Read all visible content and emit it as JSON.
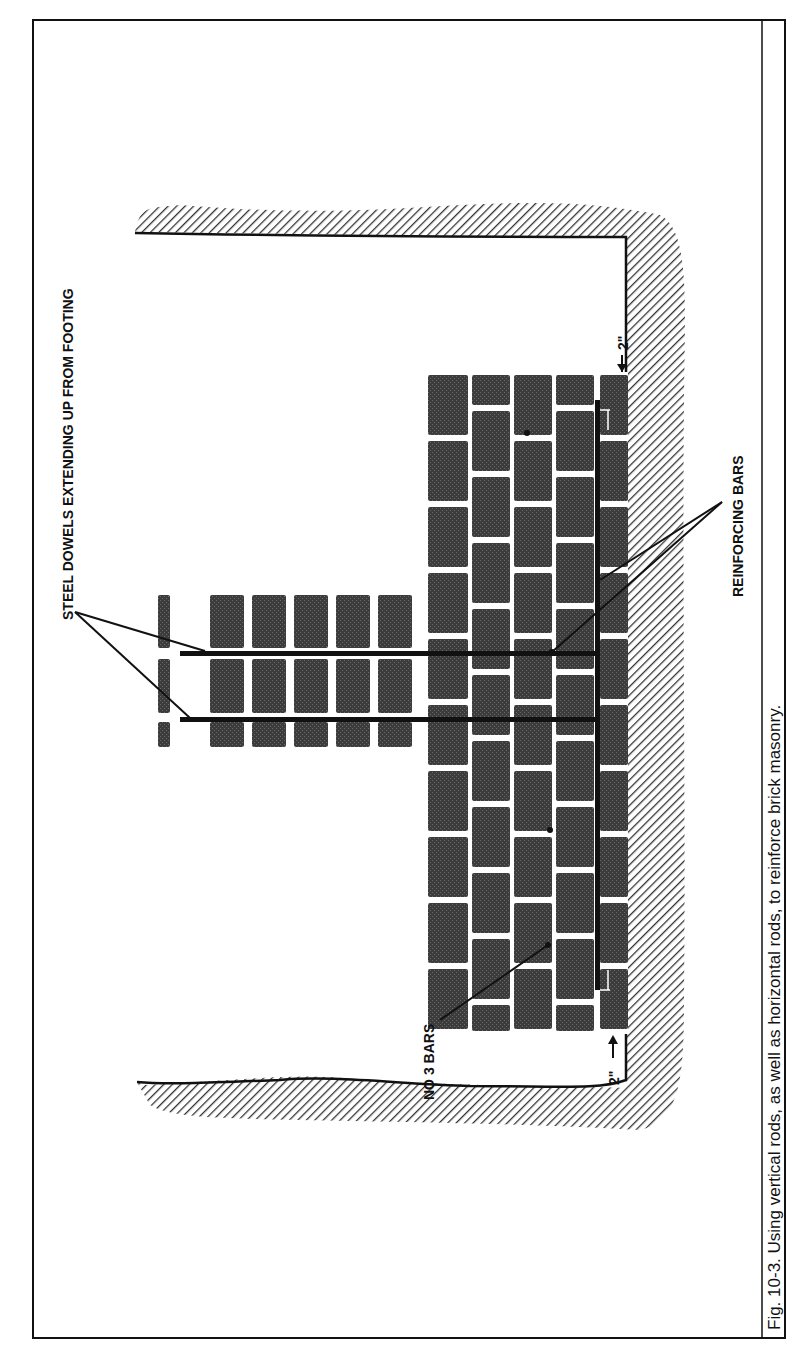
{
  "figure": {
    "caption": "Fig. 10-3. Using vertical rods, as well as horizontal rods, to reinforce brick masonry.",
    "orientation": "rotated-90-clockwise"
  },
  "labels": {
    "steel_dowels": "STEEL DOWELS EXTENDING UP FROM FOOTING",
    "reinforcing_bars": "REINFORCING BARS",
    "no3_bars": "NO 3 BARS",
    "clearance_top": "2\"",
    "clearance_bottom": "2\""
  },
  "colors": {
    "brick": "#3a3a3a",
    "mortar": "#ffffff",
    "hatch": "#333333",
    "rod": "#111111",
    "border": "#111111"
  },
  "components": [
    {
      "name": "footing",
      "description": "hatched earth/footing outline"
    },
    {
      "name": "wall",
      "description": "brick wall with horizontal reinforcing bars"
    },
    {
      "name": "pier",
      "description": "brick pier with vertical steel dowels"
    }
  ]
}
